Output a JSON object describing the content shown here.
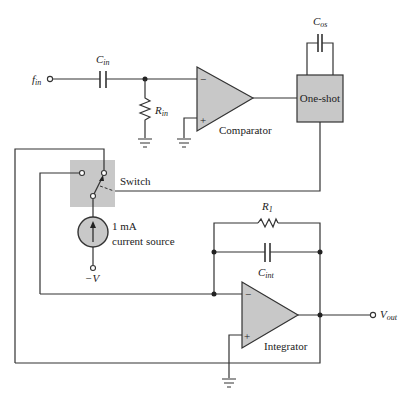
{
  "diagram": {
    "type": "circuit-schematic",
    "input_terminal": {
      "label": "f",
      "sub": "in"
    },
    "input_capacitor": {
      "label": "C",
      "sub": "in"
    },
    "input_resistor": {
      "label": "R",
      "sub": "in"
    },
    "comparator": {
      "label": "Comparator",
      "minus": "−",
      "plus": "+"
    },
    "one_shot": {
      "label": "One-shot"
    },
    "one_shot_capacitor": {
      "label": "C",
      "sub": "os"
    },
    "switch": {
      "label": "Switch"
    },
    "current_source": {
      "line1": "1 mA",
      "line2": "current source"
    },
    "neg_supply": {
      "label": "−V"
    },
    "feedback_resistor": {
      "label": "R",
      "sub": "1"
    },
    "integrator_capacitor": {
      "label": "C",
      "sub": "int"
    },
    "integrator": {
      "label": "Integrator",
      "minus": "−",
      "plus": "+"
    },
    "output_terminal": {
      "label": "V",
      "sub": "out"
    },
    "colors": {
      "wire": "#333333",
      "component_fill": "#c8c8c8",
      "background": "#ffffff"
    }
  }
}
